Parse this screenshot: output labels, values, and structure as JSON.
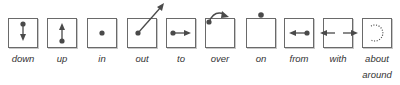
{
  "diagram": {
    "colors": {
      "stroke": "#4a4a4a",
      "box_border": "#6a6a6a",
      "text": "#333333"
    },
    "items": [
      {
        "id": "down",
        "label": "down",
        "icon": "arrow-down-icon"
      },
      {
        "id": "up",
        "label": "up",
        "icon": "arrow-up-icon"
      },
      {
        "id": "in",
        "label": "in",
        "icon": "dot-inside-icon"
      },
      {
        "id": "out",
        "label": "out",
        "icon": "arrow-out-icon"
      },
      {
        "id": "to",
        "label": "to",
        "icon": "arrow-right-icon"
      },
      {
        "id": "over",
        "label": "over",
        "icon": "arc-over-icon"
      },
      {
        "id": "on",
        "label": "on",
        "icon": "dot-on-top-icon"
      },
      {
        "id": "from",
        "label": "from",
        "icon": "arrow-left-icon"
      },
      {
        "id": "with",
        "label": "with",
        "icon": "arrows-together-icon"
      },
      {
        "id": "about",
        "label": "about",
        "label2": "around",
        "icon": "dotted-circle-icon"
      }
    ]
  }
}
